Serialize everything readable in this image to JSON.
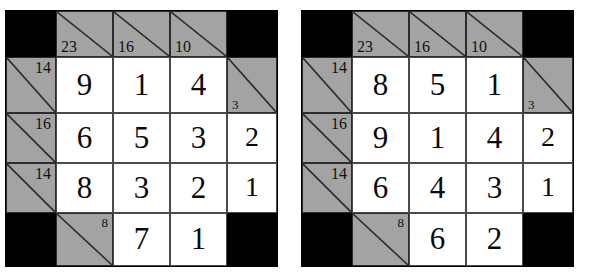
{
  "page": {
    "background_color": "#ffffff",
    "clue_cell_color": "#a3a3a3",
    "block_cell_color": "#000000",
    "entry_cell_color": "#ffffff",
    "grid_line_color": "#2b2b2b",
    "digit_color": "#0a0a0a"
  },
  "grids": [
    {
      "name": "left-grid",
      "label": "Kakuro grid 1",
      "columns": 5,
      "rows": 5,
      "clues": {
        "down": [
          {
            "column": 1,
            "value": "23"
          },
          {
            "column": 2,
            "value": "16"
          },
          {
            "column": 3,
            "value": "10"
          },
          {
            "column": 4,
            "value": "3"
          }
        ],
        "across": [
          {
            "row": 1,
            "value": "14"
          },
          {
            "row": 2,
            "value": "16"
          },
          {
            "row": 3,
            "value": "14"
          },
          {
            "row": 4,
            "value": "8"
          }
        ]
      },
      "cells": [
        [
          {
            "type": "block"
          },
          {
            "type": "clue",
            "down": "23"
          },
          {
            "type": "clue",
            "down": "16"
          },
          {
            "type": "clue",
            "down": "10"
          },
          {
            "type": "block"
          }
        ],
        [
          {
            "type": "clue",
            "across": "14"
          },
          {
            "type": "entry",
            "value": "9"
          },
          {
            "type": "entry",
            "value": "1"
          },
          {
            "type": "entry",
            "value": "4"
          },
          {
            "type": "clue",
            "down": "3"
          }
        ],
        [
          {
            "type": "clue",
            "across": "16"
          },
          {
            "type": "entry",
            "value": "6"
          },
          {
            "type": "entry",
            "value": "5"
          },
          {
            "type": "entry",
            "value": "3"
          },
          {
            "type": "entry",
            "value": "2"
          }
        ],
        [
          {
            "type": "clue",
            "across": "14"
          },
          {
            "type": "entry",
            "value": "8"
          },
          {
            "type": "entry",
            "value": "3"
          },
          {
            "type": "entry",
            "value": "2"
          },
          {
            "type": "entry",
            "value": "1"
          }
        ],
        [
          {
            "type": "block"
          },
          {
            "type": "clue",
            "across": "8"
          },
          {
            "type": "entry",
            "value": "7"
          },
          {
            "type": "entry",
            "value": "1"
          },
          {
            "type": "block"
          }
        ]
      ]
    },
    {
      "name": "right-grid",
      "label": "Kakuro grid 2",
      "columns": 5,
      "rows": 5,
      "clues": {
        "down": [
          {
            "column": 1,
            "value": "23"
          },
          {
            "column": 2,
            "value": "16"
          },
          {
            "column": 3,
            "value": "10"
          },
          {
            "column": 4,
            "value": "3"
          }
        ],
        "across": [
          {
            "row": 1,
            "value": "14"
          },
          {
            "row": 2,
            "value": "16"
          },
          {
            "row": 3,
            "value": "14"
          },
          {
            "row": 4,
            "value": "8"
          }
        ]
      },
      "cells": [
        [
          {
            "type": "block"
          },
          {
            "type": "clue",
            "down": "23"
          },
          {
            "type": "clue",
            "down": "16"
          },
          {
            "type": "clue",
            "down": "10"
          },
          {
            "type": "block"
          }
        ],
        [
          {
            "type": "clue",
            "across": "14"
          },
          {
            "type": "entry",
            "value": "8"
          },
          {
            "type": "entry",
            "value": "5"
          },
          {
            "type": "entry",
            "value": "1"
          },
          {
            "type": "clue",
            "down": "3"
          }
        ],
        [
          {
            "type": "clue",
            "across": "16"
          },
          {
            "type": "entry",
            "value": "9"
          },
          {
            "type": "entry",
            "value": "1"
          },
          {
            "type": "entry",
            "value": "4"
          },
          {
            "type": "entry",
            "value": "2"
          }
        ],
        [
          {
            "type": "clue",
            "across": "14"
          },
          {
            "type": "entry",
            "value": "6"
          },
          {
            "type": "entry",
            "value": "4"
          },
          {
            "type": "entry",
            "value": "3"
          },
          {
            "type": "entry",
            "value": "1"
          }
        ],
        [
          {
            "type": "block"
          },
          {
            "type": "clue",
            "across": "8"
          },
          {
            "type": "entry",
            "value": "6"
          },
          {
            "type": "entry",
            "value": "2"
          },
          {
            "type": "block"
          }
        ]
      ]
    }
  ]
}
